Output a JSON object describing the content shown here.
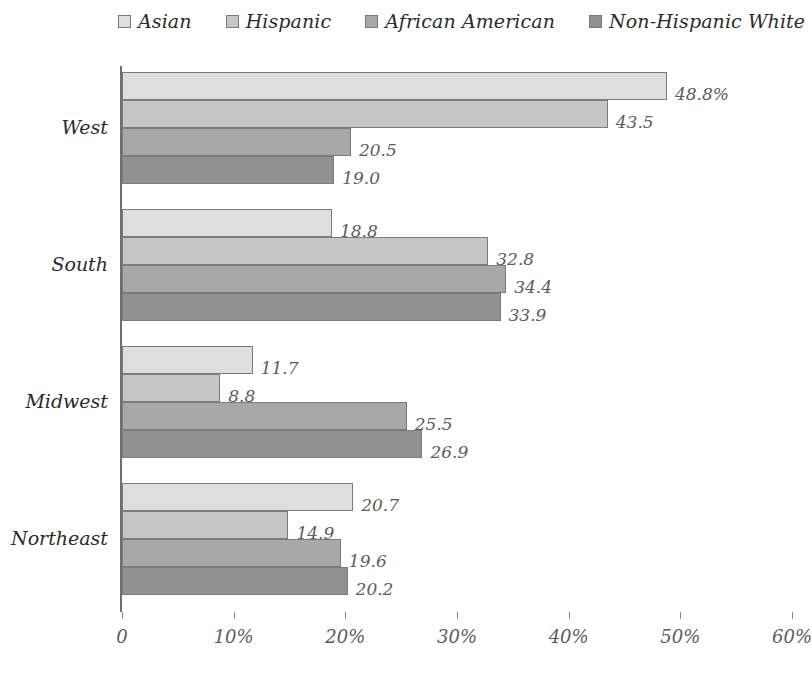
{
  "chart_data": {
    "type": "bar",
    "orientation": "horizontal",
    "title": "",
    "subtitle": "",
    "xlabel": "",
    "ylabel": "",
    "categories": [
      "West",
      "South",
      "Midwest",
      "Northeast"
    ],
    "series": [
      {
        "name": "Asian",
        "color": "#dedede",
        "values": [
          48.8,
          18.8,
          11.7,
          20.7
        ],
        "labels": [
          "48.8%",
          "18.8",
          "11.7",
          "20.7"
        ]
      },
      {
        "name": "Hispanic",
        "color": "#c6c6c6",
        "values": [
          43.5,
          32.8,
          8.8,
          14.9
        ],
        "labels": [
          "43.5",
          "32.8",
          "8.8",
          "14.9"
        ]
      },
      {
        "name": "African American",
        "color": "#a8a8a8",
        "values": [
          20.5,
          34.4,
          25.5,
          19.6
        ],
        "labels": [
          "20.5",
          "34.4",
          "25.5",
          "19.6"
        ]
      },
      {
        "name": "Non-Hispanic White",
        "color": "#919191",
        "values": [
          19.0,
          33.9,
          26.9,
          20.2
        ],
        "labels": [
          "19.0",
          "33.9",
          "26.9",
          "20.2"
        ]
      }
    ],
    "xlim": [
      0,
      60
    ],
    "xticks": [
      0,
      10,
      20,
      30,
      40,
      50,
      60
    ],
    "xtick_labels": [
      "0",
      "10%",
      "20%",
      "30%",
      "40%",
      "50%",
      "60%"
    ],
    "grid": false,
    "legend_position": "top"
  },
  "legend": {
    "items": [
      {
        "label": "Asian",
        "color": "#dedede"
      },
      {
        "label": "Hispanic",
        "color": "#c6c6c6"
      },
      {
        "label": "African American",
        "color": "#a8a8a8"
      },
      {
        "label": "Non-Hispanic White",
        "color": "#919191"
      }
    ]
  },
  "colors": {
    "axis": "#6f6f6f",
    "bar_border": "#7b7b7b",
    "label_text": "#5c5c5c",
    "category_text": "#2b2b2b",
    "background": "#ffffff"
  }
}
